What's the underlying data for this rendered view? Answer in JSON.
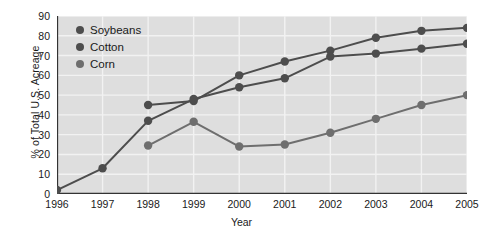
{
  "chart_data": {
    "type": "line",
    "title": "",
    "xlabel": "Year",
    "ylabel": "% of Total U.S. Acreage",
    "categories": [
      1996,
      1997,
      1998,
      1999,
      2000,
      2001,
      2002,
      2003,
      2004,
      2005
    ],
    "xtick_labels": [
      "1996",
      "1997",
      "1998",
      "1999",
      "2000",
      "2001",
      "2002",
      "2003",
      "2004",
      "2005"
    ],
    "ytick_labels": [
      "0",
      "10",
      "20",
      "30",
      "40",
      "50",
      "60",
      "70",
      "80",
      "90"
    ],
    "ylim": [
      0,
      90
    ],
    "xlim": [
      1996,
      2005
    ],
    "ytick_step": 10,
    "grid": true,
    "grid_color": "#f2f2f2",
    "plot_background": "#dedede",
    "figure_background": "#ffffff",
    "legend_position": "upper-left-inside",
    "series": [
      {
        "name": "Soybeans",
        "color": "#4d4d4d",
        "x": [
          1998,
          1999,
          2000,
          2001,
          2002,
          2003,
          2004,
          2005
        ],
        "values": [
          45,
          47,
          60,
          67,
          72.5,
          79,
          82.5,
          84
        ]
      },
      {
        "name": "Cotton",
        "color": "#4d4d4d",
        "x": [
          1996,
          1997,
          1998,
          1999,
          2000,
          2001,
          2002,
          2003,
          2004,
          2005
        ],
        "values": [
          2,
          13,
          37,
          48,
          54,
          58.5,
          69.5,
          71,
          73.5,
          76
        ]
      },
      {
        "name": "Corn",
        "color": "#6e6e6e",
        "x": [
          1998,
          1999,
          2000,
          2001,
          2002,
          2003,
          2004,
          2005
        ],
        "values": [
          24.5,
          36.5,
          24,
          25,
          31,
          38,
          45,
          50
        ]
      }
    ]
  }
}
